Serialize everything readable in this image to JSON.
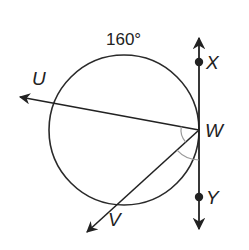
{
  "diagram": {
    "type": "geometry",
    "circle": {
      "cx": 124,
      "cy": 130,
      "r": 75,
      "stroke": "#2a2a2a"
    },
    "arc_label": {
      "text": "160°",
      "x": 106,
      "y": 45
    },
    "tangent_line": {
      "name": "XY",
      "x": 199,
      "y_top": 38,
      "y_bottom": 229,
      "points": [
        {
          "label": "X",
          "x": 199,
          "y": 62,
          "label_x": 206,
          "label_y": 69
        },
        {
          "label": "Y",
          "x": 199,
          "y": 197,
          "label_x": 206,
          "label_y": 204
        }
      ]
    },
    "vertex": {
      "label": "W",
      "x": 199,
      "y": 130,
      "label_x": 205,
      "label_y": 137
    },
    "rays": [
      {
        "label": "U",
        "from_x": 199,
        "from_y": 130,
        "to_x": 20,
        "to_y": 97,
        "label_x": 32,
        "label_y": 85
      },
      {
        "label": "V",
        "from_x": 199,
        "from_y": 130,
        "to_x": 87,
        "to_y": 232,
        "label_x": 108,
        "label_y": 226
      }
    ],
    "angle_marks": [
      {
        "description": "angle UWV",
        "color": "#9a9a9a"
      },
      {
        "description": "angle VWY",
        "color": "#9a9a9a"
      }
    ],
    "colors": {
      "stroke": "#222222",
      "angle_mark": "#9a9a9a",
      "background": "#ffffff"
    }
  }
}
